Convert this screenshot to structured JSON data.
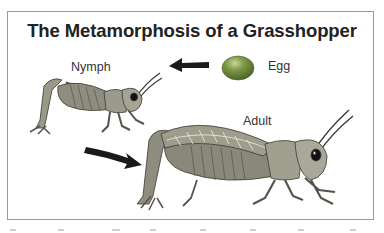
{
  "diagram": {
    "title": "The Metamorphosis of a Grasshopper",
    "stages": [
      {
        "id": "egg",
        "label": "Egg"
      },
      {
        "id": "nymph",
        "label": "Nymph"
      },
      {
        "id": "adult",
        "label": "Adult"
      }
    ],
    "arrows": [
      {
        "from": "egg",
        "to": "nymph",
        "direction": "left"
      },
      {
        "from": "nymph",
        "to": "adult",
        "direction": "down-right"
      }
    ],
    "colors": {
      "egg": "#6e8e3e",
      "grasshopper": "#8a8a7a",
      "arrow": "#1a1a1a",
      "border": "#9a9a9a",
      "text": "#222222"
    }
  }
}
